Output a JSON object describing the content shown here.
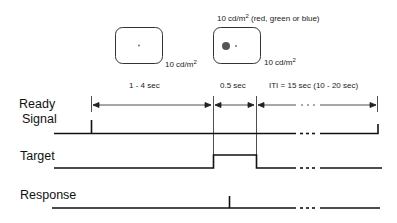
{
  "stimuli": {
    "fixation_box": {
      "luminance_label": "10 cd/m",
      "luminance_sup": "2"
    },
    "target_box": {
      "top_label": "10 cd/m",
      "top_sup": "2",
      "top_suffix": " (red, green or blue)",
      "luminance_label": "10 cd/m",
      "luminance_sup": "2"
    }
  },
  "intervals": [
    {
      "label": "1 - 4 sec"
    },
    {
      "label": "0.5 sec"
    },
    {
      "label": "ITI = 15 sec (10 - 20 sec)"
    }
  ],
  "signals": {
    "ready_line1": "Ready",
    "ready_line2": "Signal",
    "target": "Target",
    "response": "Response"
  },
  "colors": {
    "line": "#111111",
    "box_border": "#333333",
    "target_dot": "#555555"
  }
}
